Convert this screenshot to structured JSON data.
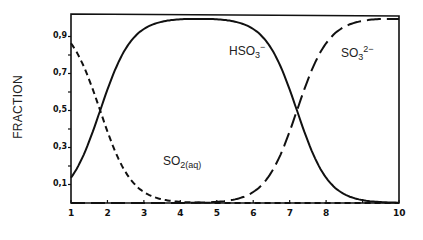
{
  "chart_data": {
    "type": "line",
    "title": "",
    "xlabel": "",
    "ylabel": "FRACTION",
    "xlim": [
      1,
      10
    ],
    "ylim": [
      0,
      1
    ],
    "x_ticks": [
      1,
      2,
      3,
      4,
      5,
      6,
      7,
      8,
      9,
      10
    ],
    "x_tick_labels": [
      "1",
      "2",
      "3",
      "4",
      "5",
      "6",
      "7",
      "8",
      "",
      "10"
    ],
    "y_ticks": [
      0.1,
      0.2,
      0.3,
      0.4,
      0.5,
      0.6,
      0.7,
      0.8,
      0.9
    ],
    "y_tick_labels": [
      "0,1",
      "",
      "0,3",
      "",
      "0,5",
      "",
      "0,7",
      "",
      "0,9"
    ],
    "grid": false,
    "legend": "inline labels",
    "pKa1": 1.8,
    "pKa2": 7.2,
    "x": [
      1,
      1.5,
      2,
      2.5,
      3,
      3.5,
      4,
      4.5,
      5,
      5.5,
      6,
      6.5,
      7,
      7.5,
      8,
      8.5,
      9,
      9.5,
      10
    ],
    "series": [
      {
        "name": "SO2(aq)",
        "style": "dashed",
        "values": [
          0.86,
          0.67,
          0.39,
          0.17,
          0.06,
          0.02,
          0.01,
          0.0,
          0.0,
          0.0,
          0.0,
          0.0,
          0.0,
          0.0,
          0.0,
          0.0,
          0.0,
          0.0,
          0.0
        ]
      },
      {
        "name": "HSO3-",
        "style": "solid",
        "values": [
          0.14,
          0.33,
          0.61,
          0.83,
          0.94,
          0.98,
          0.99,
          1.0,
          0.99,
          0.98,
          0.94,
          0.83,
          0.61,
          0.33,
          0.14,
          0.05,
          0.02,
          0.01,
          0.0
        ]
      },
      {
        "name": "SO3 2-",
        "style": "long-dashed",
        "values": [
          0.0,
          0.0,
          0.0,
          0.0,
          0.0,
          0.0,
          0.0,
          0.0,
          0.01,
          0.02,
          0.06,
          0.17,
          0.39,
          0.67,
          0.86,
          0.95,
          0.98,
          0.99,
          1.0
        ]
      }
    ],
    "annotations": [
      {
        "text": "SO2(aq)",
        "x": 3.8,
        "y": 0.22
      },
      {
        "text": "HSO3−",
        "x": 6.3,
        "y": 0.82
      },
      {
        "text": "SO3 2−",
        "x": 8.4,
        "y": 0.82
      }
    ]
  },
  "labels": {
    "ylabel": "FRACTION",
    "so2": {
      "base": "SO",
      "sub": "2(aq)"
    },
    "hso3": {
      "base": "HSO",
      "sub": "3",
      "sup": "−"
    },
    "so3": {
      "base": "SO",
      "sub": "3",
      "sup": "2−"
    }
  }
}
